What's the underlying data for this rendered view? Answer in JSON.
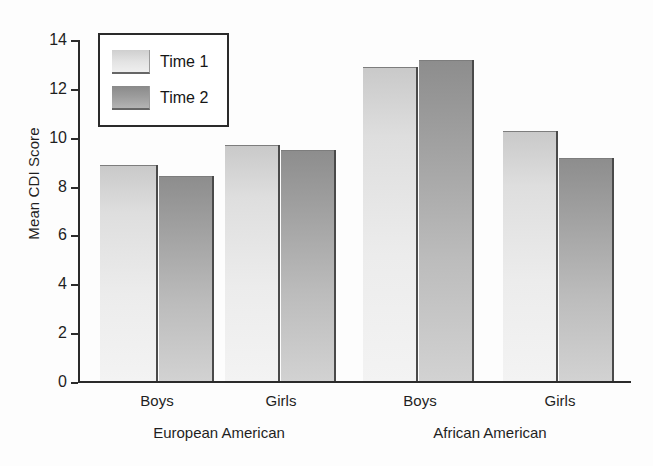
{
  "chart_data": {
    "type": "bar",
    "title": "",
    "subtitle": "",
    "xlabel": "",
    "ylabel": "Mean CDI Score",
    "ylim": [
      0,
      14
    ],
    "yticks": [
      0,
      2,
      4,
      6,
      8,
      10,
      12,
      14
    ],
    "ytick_labels": [
      "0",
      "2",
      "4",
      "6",
      "8",
      "10",
      "12",
      "14"
    ],
    "grid": false,
    "legend_position": "upper-left-inside",
    "categories": [
      "Boys",
      "Girls",
      "Boys",
      "Girls"
    ],
    "groups": [
      {
        "name": "European American",
        "categories": [
          "Boys",
          "Girls"
        ]
      },
      {
        "name": "African American",
        "categories": [
          "Boys",
          "Girls"
        ]
      }
    ],
    "series": [
      {
        "name": "Time 1",
        "color": "#e4e4e4",
        "values": [
          8.85,
          9.7,
          12.9,
          10.25
        ]
      },
      {
        "name": "Time 2",
        "color": "#a0a0a0",
        "values": [
          8.4,
          9.5,
          13.2,
          9.15
        ]
      }
    ],
    "bars": [
      {
        "label": "Boys",
        "group": "European American",
        "series": "Time 1",
        "value": 8.85
      },
      {
        "label": "Boys",
        "group": "European American",
        "series": "Time 2",
        "value": 8.4
      },
      {
        "label": "Girls",
        "group": "European American",
        "series": "Time 1",
        "value": 9.7
      },
      {
        "label": "Girls",
        "group": "European American",
        "series": "Time 2",
        "value": 9.5
      },
      {
        "label": "Boys",
        "group": "African American",
        "series": "Time 1",
        "value": 12.9
      },
      {
        "label": "Boys",
        "group": "African American",
        "series": "Time 2",
        "value": 13.2
      },
      {
        "label": "Girls",
        "group": "African American",
        "series": "Time 1",
        "value": 10.25
      },
      {
        "label": "Girls",
        "group": "African American",
        "series": "Time 2",
        "value": 9.15
      }
    ]
  },
  "axis": {
    "y_title": "Mean CDI Score",
    "ticks": [
      "14",
      "12",
      "10",
      "8",
      "6",
      "4",
      "2",
      "0"
    ]
  },
  "legend": {
    "entries": [
      {
        "label": "Time 1",
        "swatch": "legend-swatch-time-1"
      },
      {
        "label": "Time 2",
        "swatch": "legend-swatch-time-2"
      }
    ]
  },
  "category_labels": [
    "Boys",
    "Girls",
    "Boys",
    "Girls"
  ],
  "group_labels": [
    "European American",
    "African American"
  ],
  "colors": {
    "axis": "#2b2b2b",
    "text": "#1f1f1f",
    "time1": "#e4e4e4",
    "time2": "#a0a0a0",
    "background": "#fdfdfd"
  }
}
